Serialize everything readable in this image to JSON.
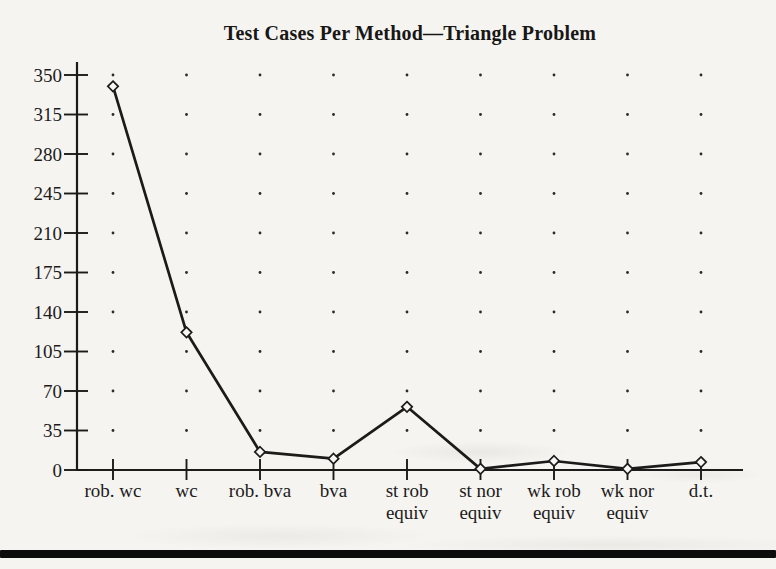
{
  "page": {
    "background_color": "#f5f4f1",
    "ink_color": "#1c1b1a",
    "divider_bar_color": "#0c0c0c"
  },
  "chart_data": {
    "type": "line",
    "title": "Test Cases Per Method—Triangle Problem",
    "categories": [
      "rob. wc",
      "wc",
      "rob. bva",
      "bva",
      "st rob equiv",
      "st nor equiv",
      "wk rob equiv",
      "wk nor equiv",
      "d.t."
    ],
    "category_label_lines": [
      [
        "rob. wc"
      ],
      [
        "wc"
      ],
      [
        "rob. bva"
      ],
      [
        "bva"
      ],
      [
        "st rob",
        "equiv"
      ],
      [
        "st nor",
        "equiv"
      ],
      [
        "wk rob",
        "equiv"
      ],
      [
        "wk nor",
        "equiv"
      ],
      [
        "d.t."
      ]
    ],
    "values": [
      340,
      122,
      16,
      10,
      56,
      1,
      8,
      1,
      7
    ],
    "yticks": [
      0,
      35,
      70,
      105,
      140,
      175,
      210,
      245,
      280,
      315,
      350
    ],
    "ylim": [
      0,
      350
    ],
    "xlabel": "",
    "ylabel": "",
    "legend": "none",
    "grid": "dotted-intersections",
    "marker": "open-diamond",
    "line_color": "#1c1b1a",
    "marker_fill": "#f8f7f4",
    "grid_dot_color": "#2b2a28"
  }
}
